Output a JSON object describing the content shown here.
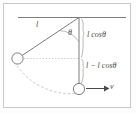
{
  "figure": {
    "colors": {
      "frame": "#c9c9c9",
      "stroke": "#6e6e6e",
      "light_stroke": "#9a9a9a",
      "dashed": "#b0b0b0",
      "text": "#4a4a4a",
      "background": "#ffffff"
    },
    "labels": {
      "string_length": "l",
      "angle": "θ",
      "vertical_projection": "l cosθ",
      "height_drop": "l − l cosθ",
      "velocity": "v"
    },
    "elements": {
      "ceiling_line": "ceiling-line",
      "pivot": "pivot-point",
      "string_displaced": "string-displaced",
      "string_vertical": "string-vertical",
      "bob_displaced": "bob-displaced",
      "bob_lowest": "bob-lowest",
      "angle_arc": "angle-arc",
      "swing_arc": "swing-arc",
      "level_dotted": "level-dotted-line",
      "brace_upper": "brace-l-cos-theta",
      "brace_lower": "brace-l-minus-l-cos-theta",
      "velocity_arrow": "velocity-arrow"
    },
    "geometry": {
      "pivot": [
        79,
        17
      ],
      "bob_displaced": [
        17,
        58
      ],
      "bob_lowest": [
        79,
        89
      ],
      "ceiling_x_start": 18,
      "ceiling_x_end": 126,
      "bob_radius": 5.5,
      "angle_degrees": 63
    }
  }
}
